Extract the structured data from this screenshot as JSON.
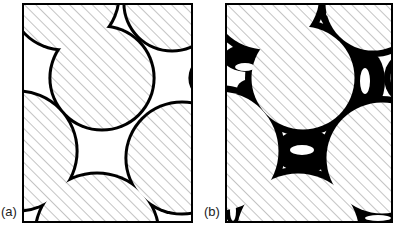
{
  "figure": {
    "panels": [
      {
        "id": "a",
        "label": "(a)",
        "label_pos": {
          "left": 1
        },
        "frame": {
          "left": 22,
          "width": 171,
          "height": 220
        },
        "mode": "thin",
        "pore_fill": "#ffffff",
        "binder_width": 3.2,
        "circles": [
          {
            "cx": 42,
            "cy": -8,
            "r": 55
          },
          {
            "cx": 150,
            "cy": 0,
            "r": 48
          },
          {
            "cx": 80,
            "cy": 75,
            "r": 52
          },
          {
            "cx": 190,
            "cy": 75,
            "r": 22
          },
          {
            "cx": -5,
            "cy": 148,
            "r": 60
          },
          {
            "cx": 160,
            "cy": 155,
            "r": 56
          },
          {
            "cx": 75,
            "cy": 232,
            "r": 62
          }
        ]
      },
      {
        "id": "b",
        "label": "(b)",
        "label_pos": {
          "left": 204
        },
        "frame": {
          "left": 225,
          "width": 168,
          "height": 220
        },
        "mode": "thick",
        "pore_fill": "#ffffff",
        "binder_width": 3.2,
        "circles": [
          {
            "cx": 40,
            "cy": -8,
            "r": 55
          },
          {
            "cx": 148,
            "cy": 0,
            "r": 48
          },
          {
            "cx": 78,
            "cy": 75,
            "r": 52
          },
          {
            "cx": 187,
            "cy": 75,
            "r": 22
          },
          {
            "cx": -6,
            "cy": 148,
            "r": 60
          },
          {
            "cx": 157,
            "cy": 155,
            "r": 56
          },
          {
            "cx": 73,
            "cy": 232,
            "r": 62
          }
        ],
        "binder_blobs": [
          {
            "cx": 103,
            "cy": 8,
            "rx": 9,
            "ry": 14
          },
          {
            "cx": 24,
            "cy": 55,
            "rx": 26,
            "ry": 14
          },
          {
            "cx": 26,
            "cy": 86,
            "rx": 14,
            "ry": 10
          },
          {
            "cx": 140,
            "cy": 78,
            "rx": 20,
            "ry": 32
          },
          {
            "cx": 80,
            "cy": 148,
            "rx": 30,
            "ry": 22
          },
          {
            "cx": 10,
            "cy": 200,
            "rx": 12,
            "ry": 22
          },
          {
            "cx": 150,
            "cy": 210,
            "rx": 22,
            "ry": 12
          }
        ],
        "pore_holes": [
          {
            "cx": 103,
            "cy": 11,
            "rx": 2,
            "ry": 2
          },
          {
            "cx": 140,
            "cy": 78,
            "rx": 5,
            "ry": 13
          },
          {
            "cx": 77,
            "cy": 147,
            "rx": 12,
            "ry": 5
          },
          {
            "cx": 20,
            "cy": 64,
            "rx": 10,
            "ry": 4
          },
          {
            "cx": 8,
            "cy": 208,
            "rx": 3,
            "ry": 10
          },
          {
            "cx": 153,
            "cy": 215,
            "rx": 13,
            "ry": 3
          }
        ]
      }
    ],
    "colors": {
      "outline": "#000000",
      "hatch": "#8a8a8a",
      "particle_fill": "#ffffff",
      "binder": "#000000"
    }
  }
}
